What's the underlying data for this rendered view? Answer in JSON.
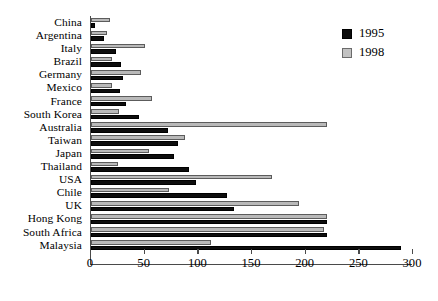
{
  "chart_data": {
    "type": "bar",
    "orientation": "horizontal",
    "title": "",
    "xlabel": "",
    "ylabel": "",
    "xlim": [
      0,
      300
    ],
    "xticks": [
      0,
      50,
      100,
      150,
      200,
      250,
      300
    ],
    "grid": false,
    "legend_position": "top-right",
    "categories": [
      "China",
      "Argentina",
      "Italy",
      "Brazil",
      "Germany",
      "Mexico",
      "France",
      "South Korea",
      "Australia",
      "Taiwan",
      "Japan",
      "Thailand",
      "USA",
      "Chile",
      "UK",
      "Hong Kong",
      "South Africa",
      "Malaysia"
    ],
    "series": [
      {
        "name": "1995",
        "color": "#0d0d0d",
        "values": [
          4,
          12,
          23,
          28,
          30,
          27,
          33,
          45,
          72,
          81,
          77,
          91,
          98,
          127,
          133,
          220,
          220,
          289
        ]
      },
      {
        "name": "1998",
        "color": "#b9b9b9",
        "values": [
          18,
          15,
          50,
          20,
          47,
          20,
          57,
          26,
          220,
          88,
          54,
          25,
          169,
          73,
          194,
          220,
          217,
          112
        ]
      }
    ]
  },
  "legend": {
    "items": [
      {
        "label": "1995"
      },
      {
        "label": "1998"
      }
    ]
  }
}
